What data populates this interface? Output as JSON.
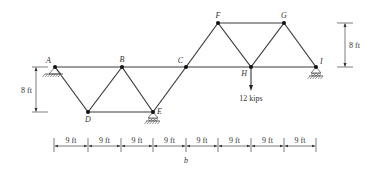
{
  "figure": {
    "caption": "b",
    "nodes": [
      {
        "id": "A",
        "label": "A"
      },
      {
        "id": "B",
        "label": "B"
      },
      {
        "id": "C",
        "label": "C"
      },
      {
        "id": "D",
        "label": "D"
      },
      {
        "id": "E",
        "label": "E"
      },
      {
        "id": "F",
        "label": "F"
      },
      {
        "id": "G",
        "label": "G"
      },
      {
        "id": "H",
        "label": "H"
      },
      {
        "id": "I",
        "label": "I"
      }
    ],
    "members": [
      [
        "A",
        "B"
      ],
      [
        "B",
        "C"
      ],
      [
        "C",
        "H"
      ],
      [
        "H",
        "I"
      ],
      [
        "A",
        "D"
      ],
      [
        "D",
        "B"
      ],
      [
        "B",
        "E"
      ],
      [
        "E",
        "C"
      ],
      [
        "D",
        "E"
      ],
      [
        "C",
        "F"
      ],
      [
        "F",
        "G"
      ],
      [
        "F",
        "H"
      ],
      [
        "H",
        "G"
      ],
      [
        "G",
        "I"
      ]
    ],
    "supports": [
      {
        "node": "A",
        "type": "pin"
      },
      {
        "node": "E",
        "type": "roller"
      },
      {
        "node": "I",
        "type": "roller"
      }
    ],
    "load": {
      "node": "H",
      "label": "12 kips",
      "direction": "down"
    },
    "left_height_dim": "8 ft",
    "right_height_dim": "8 ft",
    "span_dims": [
      "9 ft",
      "9 ft",
      "9 ft",
      "9 ft",
      "9 ft",
      "9 ft",
      "9 ft",
      "9 ft"
    ]
  }
}
